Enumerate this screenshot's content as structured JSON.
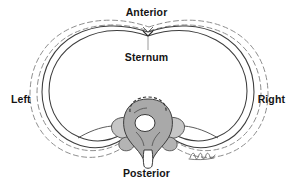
{
  "figure": {
    "background_color": "#ffffff"
  },
  "labels": {
    "anterior": "Anterior",
    "sternum": "Sternum",
    "posterior": "Posterior",
    "left": "Left",
    "right": "Right"
  },
  "annotations": {
    "signature": "artist-signature"
  },
  "colors": {
    "text": "#141414",
    "outline": "#3a3a3a",
    "dashed_outline": "#8e8e8e",
    "leader_line": "#9a9a9a",
    "bone_fill": "#a8a8a8",
    "bone_light_fill": "#c9c9c9",
    "canal_fill": "#ffffff"
  },
  "structures": {
    "rib_cage_solid": "rib cage outline at resting position",
    "rib_cage_dashed": "rib cage outline displaced during inspiration",
    "vertebra": "thoracic vertebra with body, pedicles, transverse processes and spinous process",
    "vertebral_canal": "vertebral foramen"
  }
}
